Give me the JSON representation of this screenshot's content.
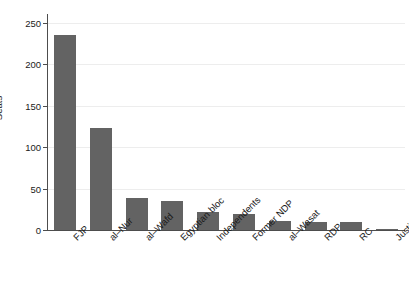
{
  "chart_data": {
    "type": "bar",
    "title": "",
    "xlabel": "",
    "ylabel": "Seats",
    "ylim": [
      0,
      250
    ],
    "yticks": [
      0,
      50,
      100,
      150,
      200,
      250
    ],
    "ytick_labels": [
      "0",
      "50",
      "100",
      "150",
      "200",
      "250"
    ],
    "grid": "horizontal",
    "legend": "none",
    "bar_color": "#636363",
    "axis_color": "#4d4d4d",
    "grid_color": "#ededed",
    "categories": [
      "FJP",
      "al–Nur",
      "al–Wafd",
      "Egyptian bloc",
      "Independents",
      "Former NDP",
      "al–Wasat",
      "RDP",
      "RC",
      "Justice"
    ],
    "values": [
      235,
      123,
      39,
      35,
      22,
      19,
      11,
      10,
      10,
      1
    ]
  }
}
